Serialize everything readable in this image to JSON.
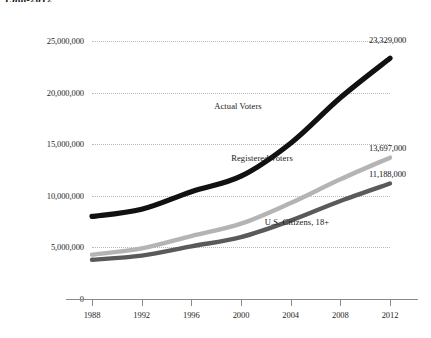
{
  "chart_data": {
    "type": "line",
    "title": "1988-2012",
    "xlabel": "",
    "ylabel": "",
    "x": [
      1988,
      1992,
      1996,
      2000,
      2004,
      2008,
      2012
    ],
    "xtick_labels": [
      "1988",
      "1992",
      "1996",
      "2000",
      "2004",
      "2008",
      "2012"
    ],
    "ytick_labels": [
      "0",
      "5,000,000",
      "10,000,000",
      "15,000,000",
      "20,000,000",
      "25,000,000"
    ],
    "ytick_values": [
      0,
      5000000,
      10000000,
      15000000,
      20000000,
      25000000
    ],
    "ylim": [
      0,
      25000000
    ],
    "xlim": [
      1988,
      2012
    ],
    "grid": true,
    "legend_position": "inline-annotations",
    "series": [
      {
        "name": "Actual Voters",
        "color": "#111111",
        "values": [
          8000000,
          8700000,
          10400000,
          11900000,
          15100000,
          19500000,
          23329000
        ],
        "end_label": "23,329,000"
      },
      {
        "name": "Registered Voters",
        "color": "#b4b4b4",
        "values": [
          4300000,
          4900000,
          6100000,
          7300000,
          9300000,
          11600000,
          13697000
        ],
        "end_label": "13,697,000"
      },
      {
        "name": "U.S. Citizens, 18+",
        "color": "#5a5a5a",
        "values": [
          3800000,
          4200000,
          5100000,
          6000000,
          7600000,
          9500000,
          11188000
        ],
        "end_label": "11,188,000"
      }
    ],
    "annotations": [
      {
        "text": "Actual Voters",
        "x_px": 238,
        "y_px": 106
      },
      {
        "text": "Registered Voters",
        "x_px": 262,
        "y_px": 158
      },
      {
        "text": "U.S. Citizens, 18+",
        "x_px": 297,
        "y_px": 222
      }
    ]
  }
}
